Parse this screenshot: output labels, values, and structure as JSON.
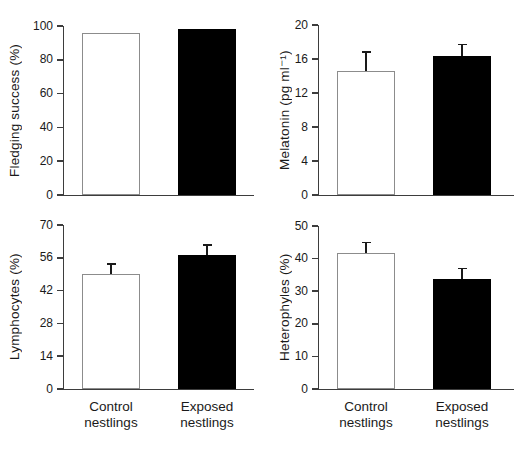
{
  "figure": {
    "background": "#ffffff",
    "colors": {
      "control_bar_fill": "#ffffff",
      "control_bar_border": "#8c8c8c",
      "exposed_bar_fill": "#000000",
      "axis": "#3d3d3d",
      "error_bar": "#1a1a1a",
      "text": "#1a1a1a"
    },
    "categories": [
      "Control nestlings",
      "Exposed nestlings"
    ],
    "legend": "none",
    "grid": false
  },
  "chart_data": [
    {
      "type": "bar",
      "position": "top-left",
      "title": "",
      "xlabel": "",
      "ylabel": "Fledging success (%)",
      "ylim": [
        0,
        100
      ],
      "yticks": [
        0,
        20,
        40,
        60,
        80,
        100
      ],
      "categories": [
        "Control nestlings",
        "Exposed nestlings"
      ],
      "values": [
        96,
        98
      ],
      "errors_up": [
        0,
        0
      ],
      "show_x_labels": false
    },
    {
      "type": "bar",
      "position": "top-right",
      "title": "",
      "xlabel": "",
      "ylabel": "Melatonin (pg ml⁻¹)",
      "ylim": [
        0,
        20
      ],
      "yticks": [
        0,
        4,
        8,
        12,
        16,
        20
      ],
      "categories": [
        "Control nestlings",
        "Exposed nestlings"
      ],
      "values": [
        14.6,
        16.3
      ],
      "errors_up": [
        2.2,
        1.4
      ],
      "show_x_labels": false
    },
    {
      "type": "bar",
      "position": "bottom-left",
      "title": "",
      "xlabel": "",
      "ylabel": "Lymphocytes (%)",
      "ylim": [
        0,
        70
      ],
      "yticks": [
        0,
        14,
        28,
        42,
        56,
        70
      ],
      "categories": [
        "Control nestlings",
        "Exposed nestlings"
      ],
      "values": [
        49,
        57
      ],
      "errors_up": [
        4.4,
        4.4
      ],
      "show_x_labels": true
    },
    {
      "type": "bar",
      "position": "bottom-right",
      "title": "",
      "xlabel": "",
      "ylabel": "Heterophyles (%)",
      "ylim": [
        0,
        50
      ],
      "yticks": [
        0,
        10,
        20,
        30,
        40,
        50
      ],
      "categories": [
        "Control nestlings",
        "Exposed nestlings"
      ],
      "values": [
        41.7,
        33.6
      ],
      "errors_up": [
        3.3,
        3.4
      ],
      "show_x_labels": true
    }
  ]
}
